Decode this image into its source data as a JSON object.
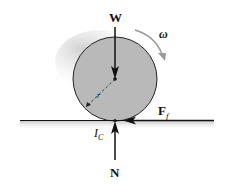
{
  "diagram": {
    "labels": {
      "weight": "W",
      "normal": "N",
      "friction_main": "F",
      "friction_sub": "f",
      "omega": "ω",
      "radius": "r",
      "ic_main": "I",
      "ic_sub": "C"
    },
    "colors": {
      "disk_fill": "#b9b9b9",
      "ground_shadow": "#c8c8c8",
      "line": "#111111",
      "omega_arrow": "#9a9a9a"
    }
  }
}
